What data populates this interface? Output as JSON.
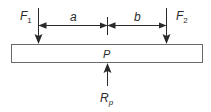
{
  "diagram": {
    "type": "beam-force-diagram",
    "colors": {
      "stroke": "#2a2a2a",
      "beam_fill": "#ffffff",
      "beam_stroke": "#6a6a6a",
      "background": "#ffffff"
    },
    "beam": {
      "label": "P"
    },
    "forces": [
      {
        "id": "F1",
        "label_main": "F",
        "label_sub": "1",
        "direction": "down"
      },
      {
        "id": "F2",
        "label_main": "F",
        "label_sub": "2",
        "direction": "down"
      }
    ],
    "reaction": {
      "id": "Rp",
      "label_main": "R",
      "label_sub": "p",
      "direction": "up"
    },
    "dimensions": [
      {
        "id": "a",
        "label": "a",
        "from": "F1",
        "to": "P"
      },
      {
        "id": "b",
        "label": "b",
        "from": "P",
        "to": "F2"
      }
    ]
  }
}
